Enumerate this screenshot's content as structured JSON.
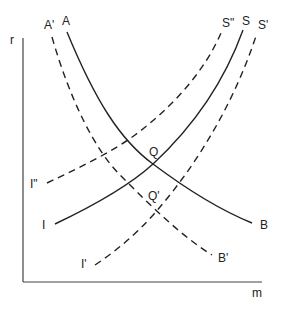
{
  "diagram": {
    "type": "IS-LM style curve shift diagram",
    "axes": {
      "y_label": "r",
      "x_label": "m"
    },
    "curves": [
      {
        "id": "AB",
        "start_label": "A",
        "end_label": "B",
        "style": "solid",
        "direction": "downward-sloping"
      },
      {
        "id": "A'B'",
        "start_label": "A'",
        "end_label": "B'",
        "style": "dashed",
        "direction": "downward-sloping"
      },
      {
        "id": "IS",
        "start_label": "I",
        "end_label": "S",
        "style": "solid",
        "direction": "upward-sloping"
      },
      {
        "id": "I'S'",
        "start_label": "I'",
        "end_label": "S'",
        "style": "dashed",
        "direction": "upward-sloping"
      },
      {
        "id": "I''S''",
        "start_label": "I\"",
        "end_label": "S\"",
        "style": "dashed",
        "direction": "upward-sloping"
      }
    ],
    "points": [
      {
        "label": "Q",
        "description": "intersection of AB and IS"
      },
      {
        "label": "Q'",
        "description": "intersection of A'B' and I'S'"
      }
    ],
    "colors": {
      "line": "#222222",
      "axis": "#444444",
      "background": "#ffffff"
    }
  }
}
